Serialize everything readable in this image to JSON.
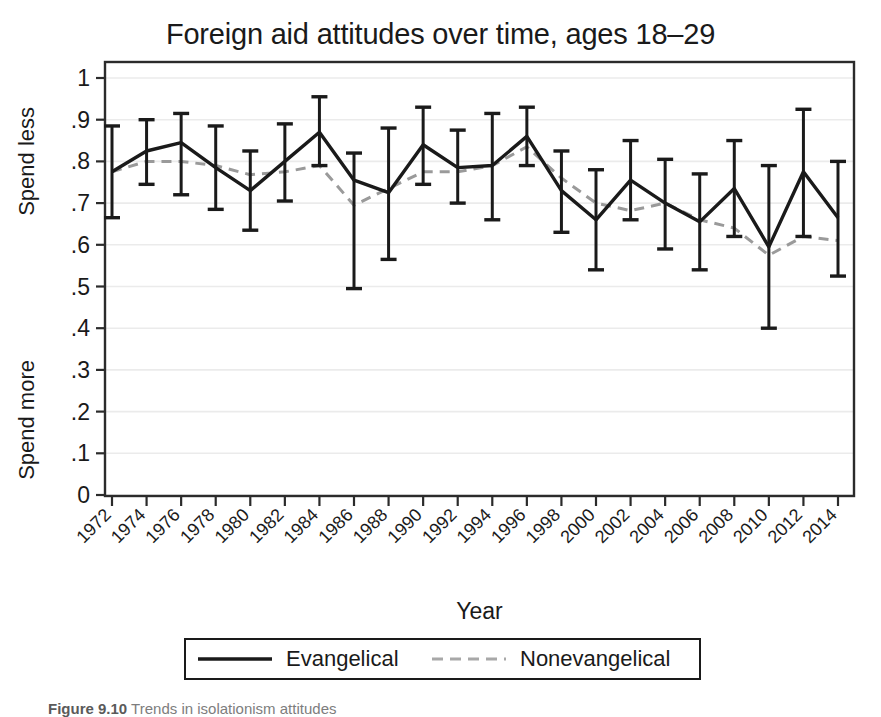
{
  "figure": {
    "title": "Foreign aid attitudes over time, ages 18–29",
    "caption_prefix": "Figure 9.10",
    "caption_text": "  Trends in isolationism attitudes"
  },
  "axes": {
    "x_title": "Year",
    "y_label_top": "Spend less",
    "y_label_bottom": "Spend more"
  },
  "legend": {
    "items": [
      {
        "label": "Evangelical",
        "style": "solid",
        "color": "#1a1a1a"
      },
      {
        "label": "Nonevangelical",
        "style": "dashed",
        "color": "#9a9a9a"
      }
    ]
  },
  "chart_data": {
    "type": "line",
    "title": "Foreign aid attitudes over time, ages 18–29",
    "xlabel": "Year",
    "ylabel": "",
    "ylim": [
      0,
      1
    ],
    "xlim": [
      1972,
      2014
    ],
    "yticks": [
      "0",
      ".1",
      ".2",
      ".3",
      ".4",
      ".5",
      ".6",
      ".7",
      ".8",
      ".9",
      "1"
    ],
    "ytick_values": [
      0,
      0.1,
      0.2,
      0.3,
      0.4,
      0.5,
      0.6,
      0.7,
      0.8,
      0.9,
      1
    ],
    "x": [
      1972,
      1974,
      1976,
      1978,
      1980,
      1982,
      1984,
      1986,
      1988,
      1990,
      1992,
      1994,
      1996,
      1998,
      2000,
      2002,
      2004,
      2006,
      2008,
      2010,
      2012,
      2014
    ],
    "categories": [
      "1972",
      "1974",
      "1976",
      "1978",
      "1980",
      "1982",
      "1984",
      "1986",
      "1988",
      "1990",
      "1992",
      "1994",
      "1996",
      "1998",
      "2000",
      "2002",
      "2004",
      "2006",
      "2008",
      "2010",
      "2012",
      "2014"
    ],
    "grid": true,
    "legend_position": "below",
    "series": [
      {
        "name": "Evangelical",
        "style": "solid",
        "color": "#1a1a1a",
        "has_error_bars": true,
        "values": [
          0.775,
          0.825,
          0.845,
          0.785,
          0.73,
          0.8,
          0.87,
          0.755,
          0.725,
          0.84,
          0.785,
          0.79,
          0.86,
          0.73,
          0.66,
          0.755,
          0.7,
          0.655,
          0.735,
          0.595,
          0.775,
          0.665
        ],
        "err_low": [
          0.665,
          0.745,
          0.72,
          0.685,
          0.635,
          0.705,
          0.79,
          0.495,
          0.565,
          0.745,
          0.7,
          0.66,
          0.79,
          0.63,
          0.54,
          0.66,
          0.59,
          0.54,
          0.62,
          0.4,
          0.62,
          0.525
        ],
        "err_high": [
          0.885,
          0.9,
          0.915,
          0.885,
          0.825,
          0.89,
          0.955,
          0.82,
          0.88,
          0.93,
          0.875,
          0.915,
          0.93,
          0.825,
          0.78,
          0.85,
          0.805,
          0.77,
          0.85,
          0.79,
          0.925,
          0.8
        ]
      },
      {
        "name": "Nonevangelical",
        "style": "dashed",
        "color": "#9a9a9a",
        "has_error_bars": false,
        "values": [
          0.775,
          0.8,
          0.8,
          0.79,
          0.768,
          0.775,
          0.79,
          0.695,
          0.735,
          0.775,
          0.775,
          0.79,
          0.835,
          0.76,
          0.7,
          0.682,
          0.7,
          0.66,
          0.64,
          0.575,
          0.62,
          0.61
        ]
      }
    ]
  }
}
